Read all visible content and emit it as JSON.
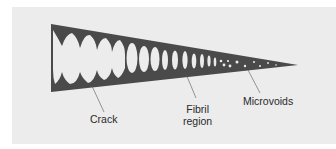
{
  "figure": {
    "type": "craze-structure-diagram",
    "colors": {
      "background": "#ffffff",
      "panel": "#ececec",
      "craze_fill": "#4a4a4a",
      "void": "#ececec",
      "leader_line": "#555555",
      "label_text": "#2a2a2a"
    },
    "labels": {
      "crack": "Crack",
      "fibril_line1": "Fibril",
      "fibril_line2": "region",
      "microvoids": "Microvoids"
    }
  }
}
